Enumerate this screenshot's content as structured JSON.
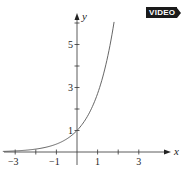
{
  "badge": {
    "label": "VIDEO"
  },
  "chart_data": {
    "type": "line",
    "title": "",
    "function": "y = e^x",
    "xlabel": "x",
    "ylabel": "y",
    "xlim": [
      -3.6,
      4.8
    ],
    "ylim": [
      -0.6,
      6.6
    ],
    "x_ticks": [
      -3,
      -2,
      -1,
      0,
      1,
      2,
      3
    ],
    "x_tick_labels": [
      "-3",
      "",
      "-1",
      "",
      "1",
      "",
      "3"
    ],
    "y_ticks": [
      1,
      2,
      3,
      4,
      5,
      6
    ],
    "y_tick_labels": [
      "1",
      "",
      "3",
      "",
      "5",
      ""
    ],
    "grid": false,
    "legend": null,
    "series": [
      {
        "name": "e^x",
        "x": [
          -3.5,
          -3,
          -2.5,
          -2,
          -1.5,
          -1,
          -0.5,
          0,
          0.5,
          1,
          1.25,
          1.5,
          1.7,
          1.8
        ],
        "y": [
          0.03,
          0.05,
          0.08,
          0.14,
          0.22,
          0.37,
          0.61,
          1.0,
          1.65,
          2.72,
          3.49,
          4.48,
          5.47,
          6.05
        ]
      }
    ],
    "color": "#555555",
    "annotations": [
      "VIDEO"
    ]
  }
}
